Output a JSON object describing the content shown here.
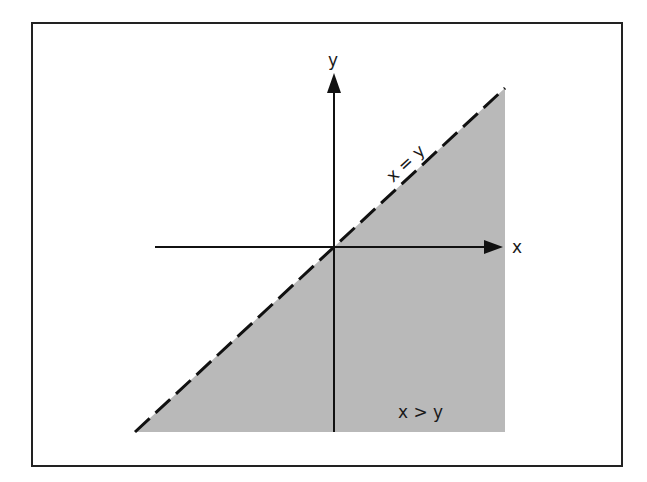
{
  "diagram": {
    "type": "inequality-region-graph",
    "axes": {
      "x_label": "x",
      "y_label": "y"
    },
    "boundary_line": {
      "label": "x = y",
      "style": "dashed"
    },
    "shaded_region": {
      "label": "x > y",
      "fill_color": "#b9b9b9"
    },
    "colors": {
      "line": "#111111",
      "frame": "#222222",
      "background": "#ffffff"
    }
  }
}
